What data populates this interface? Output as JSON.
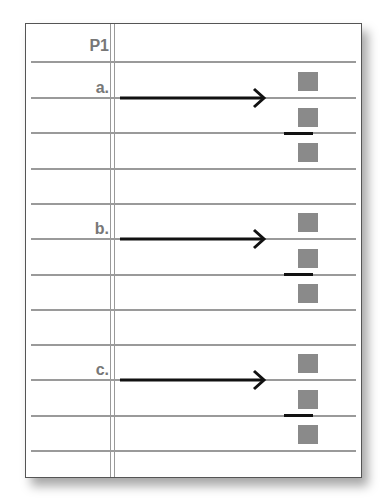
{
  "sheet": {
    "header_label": "P1",
    "items": [
      {
        "label": "a."
      },
      {
        "label": "b."
      },
      {
        "label": "c."
      }
    ]
  },
  "colors": {
    "rule_line": "#9a9a9a",
    "square": "#8a8a8a",
    "arrow": "#111111",
    "label_text": "#777777",
    "border": "#555555"
  }
}
